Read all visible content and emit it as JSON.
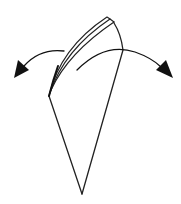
{
  "diagram": {
    "type": "folding-instruction",
    "colors": {
      "background": "#ffffff",
      "line": "#222222",
      "arrow": "#111111"
    },
    "elements": {
      "folded_shape": {
        "label": ""
      },
      "layers": {
        "count": 3
      },
      "arrow_left": {
        "direction": "left"
      },
      "arrow_right": {
        "direction": "right"
      }
    }
  }
}
